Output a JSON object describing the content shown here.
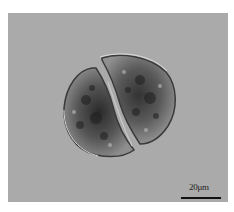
{
  "figure": {
    "background_color": "#aaaaaa",
    "scale_bar": {
      "label": "20μm",
      "color": "#111111"
    }
  }
}
